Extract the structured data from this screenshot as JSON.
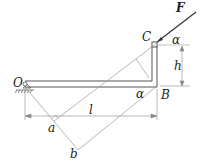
{
  "labels": {
    "F": "F",
    "C": "C",
    "alpha_top": "α",
    "h": "h",
    "O": "O",
    "alpha_bottom": "α",
    "B": "B",
    "l": "l",
    "a": "a",
    "b": "b"
  },
  "colors": {
    "line": "#555555",
    "thin": "#888888",
    "force": "#333333"
  }
}
